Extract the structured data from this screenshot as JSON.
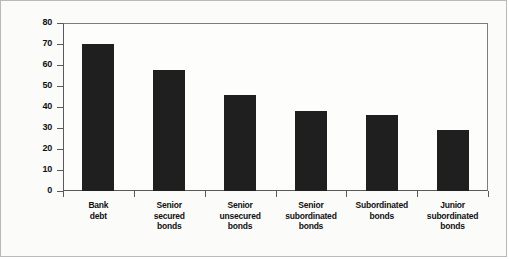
{
  "chart_data": {
    "type": "bar",
    "title": "",
    "xlabel": "",
    "ylabel": "Recovery rate, %",
    "ylim": [
      0,
      80
    ],
    "yticks": [
      0,
      10,
      20,
      30,
      40,
      50,
      60,
      70,
      80
    ],
    "grid": false,
    "legend": null,
    "bar_color": "#1f1f1f",
    "categories": [
      "Bank debt",
      "Senior secured bonds",
      "Senior unsecured bonds",
      "Senior subordinated bonds",
      "Subordinated bonds",
      "Junior subordinated bonds"
    ],
    "category_lines": [
      [
        "Bank",
        "debt"
      ],
      [
        "Senior",
        "secured",
        "bonds"
      ],
      [
        "Senior",
        "unsecured",
        "bonds"
      ],
      [
        "Senior",
        "subordinated",
        "bonds"
      ],
      [
        "Subordinated",
        "bonds"
      ],
      [
        "Junior",
        "subordinated",
        "bonds"
      ]
    ],
    "values": [
      70,
      57.5,
      45.5,
      38,
      36,
      29
    ]
  },
  "axis": {
    "y_title": "Recovery rate, %",
    "tick_labels": [
      "80",
      "70",
      "60",
      "50",
      "40",
      "30",
      "20",
      "10",
      "0"
    ]
  },
  "colors": {
    "bar": "#1f1f1f",
    "axis": "#5a5a5a",
    "frame": "#b9b9b9",
    "text": "#111111",
    "background": "#fbfbfa"
  }
}
